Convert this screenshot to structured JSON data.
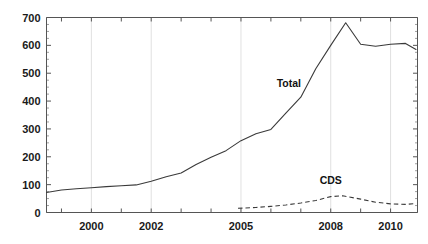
{
  "chart_data": {
    "type": "line",
    "title": "",
    "subtitle": "",
    "xlabel": "",
    "ylabel": "",
    "xlim": [
      1998.5,
      2010.9
    ],
    "ylim": [
      0,
      700
    ],
    "grid": "vertical-at-labeled-ticks",
    "legend": "inline-annotations",
    "y_ticks": [
      0,
      100,
      200,
      300,
      400,
      500,
      600,
      700
    ],
    "y_tick_labels": [
      "0",
      "100",
      "200",
      "300",
      "400",
      "500",
      "600",
      "700"
    ],
    "y_minor_tick_step": 25,
    "x_ticks": [
      1999,
      2000,
      2001,
      2002,
      2003,
      2004,
      2005,
      2006,
      2007,
      2008,
      2009,
      2010
    ],
    "x_tick_labels_shown": [
      {
        "value": 2000,
        "label": "2000"
      },
      {
        "value": 2002,
        "label": "2002"
      },
      {
        "value": 2005,
        "label": "2005"
      },
      {
        "value": 2008,
        "label": "2008"
      },
      {
        "value": 2010,
        "label": "2010"
      }
    ],
    "series": [
      {
        "name": "Total",
        "style": "solid",
        "color": "#3a3a3a",
        "annotation": "Total",
        "annotation_x": 2006.6,
        "annotation_y": 452,
        "x": [
          1998.5,
          1999.0,
          1999.5,
          2000.0,
          2000.5,
          2001.0,
          2001.5,
          2002.0,
          2002.5,
          2003.0,
          2003.5,
          2004.0,
          2004.5,
          2005.0,
          2005.5,
          2006.0,
          2006.5,
          2007.0,
          2007.5,
          2008.0,
          2008.5,
          2009.0,
          2009.5,
          2010.0,
          2010.5,
          2010.85
        ],
        "y": [
          72,
          81,
          85,
          89,
          93,
          96,
          99,
          112,
          128,
          142,
          172,
          198,
          222,
          258,
          283,
          298,
          357,
          414,
          516,
          600,
          681,
          604,
          597,
          604,
          607,
          585
        ]
      },
      {
        "name": "CDS",
        "style": "dashed",
        "color": "#3a3a3a",
        "annotation": "CDS",
        "annotation_x": 2008.0,
        "annotation_y": 101,
        "x": [
          2004.9,
          2005.5,
          2006.0,
          2006.5,
          2007.0,
          2007.5,
          2008.0,
          2008.4,
          2009.0,
          2009.5,
          2010.0,
          2010.5,
          2010.85
        ],
        "y": [
          15,
          18,
          22,
          27,
          34,
          43,
          57,
          60,
          48,
          37,
          31,
          29,
          32
        ]
      }
    ]
  }
}
